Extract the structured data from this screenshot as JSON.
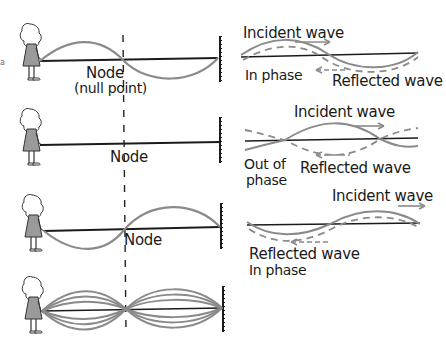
{
  "figure": {
    "left_panels": [
      {
        "id": "fundamental-half",
        "label_line1": "Node",
        "label_line2": "(null point)"
      },
      {
        "id": "flat-instant",
        "label_line1": "Node"
      },
      {
        "id": "inverted-half",
        "label_line1": "Node"
      },
      {
        "id": "standing-wave-envelope"
      }
    ],
    "right_panels": [
      {
        "incident_label": "Incident wave",
        "reflected_label": "Reflected wave",
        "phase_label": "In phase"
      },
      {
        "incident_label": "Incident wave",
        "reflected_label": "Reflected wave",
        "phase_label_line1": "Out of",
        "phase_label_line2": "phase"
      },
      {
        "incident_label": "Incident wave",
        "reflected_label": "Reflected wave",
        "phase_label": "In phase"
      }
    ],
    "colors": {
      "rope": "#1a1a1a",
      "wave": "#8a8a8a",
      "reflected_dashed": "#8a8a8a",
      "figure_fill": "#9a9a9a",
      "background": "#ffffff"
    },
    "icons": [
      "girl-figure-icon",
      "wall-icon",
      "arrow-right-icon",
      "arrow-left-icon"
    ]
  }
}
